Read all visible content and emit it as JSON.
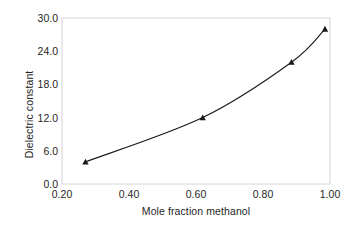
{
  "chart_data": {
    "type": "line",
    "title": "",
    "xlabel": "Mole fraction methanol",
    "ylabel": "Dielectric constant",
    "xlim": [
      0.2,
      1.0
    ],
    "ylim": [
      0.0,
      30.0
    ],
    "xticks": [
      "0.20",
      "0.40",
      "0.60",
      "0.80",
      "1.00"
    ],
    "xtick_values": [
      0.2,
      0.4,
      0.6,
      0.8,
      1.0
    ],
    "yticks": [
      "0.0",
      "6.0",
      "12.0",
      "18.0",
      "24.0",
      "30.0"
    ],
    "ytick_values": [
      0.0,
      6.0,
      12.0,
      18.0,
      24.0,
      30.0
    ],
    "grid": false,
    "legend": false,
    "marker": "triangle",
    "line_color": "#1a1a1a",
    "marker_color": "#1a1a1a",
    "frame_color": "#d4d4d4",
    "x": [
      0.27,
      0.62,
      0.885,
      0.985
    ],
    "values": [
      4.0,
      12.0,
      22.0,
      28.0
    ],
    "points": [
      {
        "x": 0.27,
        "y": 4.0
      },
      {
        "x": 0.62,
        "y": 12.0
      },
      {
        "x": 0.885,
        "y": 22.0
      },
      {
        "x": 0.985,
        "y": 28.0
      }
    ]
  }
}
